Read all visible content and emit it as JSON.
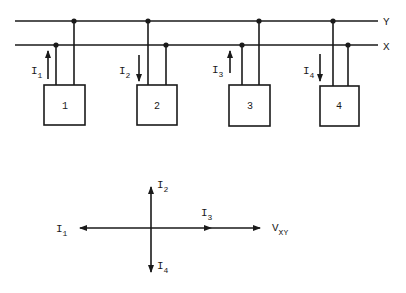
{
  "bus": {
    "y_label": "Y",
    "x_label": "X"
  },
  "units": [
    {
      "id": "1",
      "current": {
        "main": "I",
        "sub": "1"
      },
      "direction": "up"
    },
    {
      "id": "2",
      "current": {
        "main": "I",
        "sub": "2"
      },
      "direction": "down"
    },
    {
      "id": "3",
      "current": {
        "main": "I",
        "sub": "3"
      },
      "direction": "up"
    },
    {
      "id": "4",
      "current": {
        "main": "I",
        "sub": "4"
      },
      "direction": "down"
    }
  ],
  "phasor": {
    "i1": {
      "main": "I",
      "sub": "1"
    },
    "i2": {
      "main": "I",
      "sub": "2"
    },
    "i3": {
      "main": "I",
      "sub": "3"
    },
    "i4": {
      "main": "I",
      "sub": "4"
    },
    "vxy": {
      "main": "V",
      "sub": "XY"
    }
  },
  "colors": {
    "ink": "#1a1a1a",
    "background": "#ffffff"
  }
}
